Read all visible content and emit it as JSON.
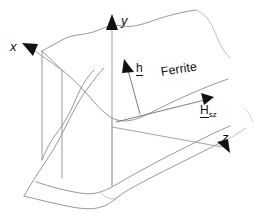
{
  "figure": {
    "background_color": "#ffffff",
    "line_color": "#8c8c8c",
    "arrow_color": "#111111",
    "width": 255,
    "height": 221
  },
  "axes": [
    {
      "id": "x",
      "label": "x",
      "direction": "up-left",
      "arrow_tip": {
        "x": 25,
        "y": 44
      },
      "arrow_tail": {
        "x": 62,
        "y": 70
      },
      "label_position": {
        "x": 10,
        "y": 40
      }
    },
    {
      "id": "y",
      "label": "y",
      "direction": "up",
      "arrow_tip": {
        "x": 112,
        "y": 16
      },
      "arrow_tail": {
        "x": 112,
        "y": 186
      },
      "label_position": {
        "x": 121,
        "y": 14
      }
    },
    {
      "id": "z",
      "label": "z",
      "direction": "down-right",
      "arrow_tip": {
        "x": 228,
        "y": 152
      },
      "arrow_tail": {
        "x": 112,
        "y": 127
      },
      "label_position": {
        "x": 222,
        "y": 131
      }
    }
  ],
  "vectors": [
    {
      "id": "h",
      "label": "h",
      "underlined": true,
      "subscript": "",
      "description": "RF magnetic field vector, normal to slab top face",
      "arrow_tip": {
        "x": 125,
        "y": 62
      },
      "arrow_tail": {
        "x": 140,
        "y": 113
      },
      "label_position": {
        "x": 136,
        "y": 62
      }
    },
    {
      "id": "Hsz",
      "label": "H",
      "underlined": true,
      "subscript": "sz",
      "description": "Static bias field along z direction",
      "arrow_tip": {
        "x": 212,
        "y": 94
      },
      "arrow_tail": {
        "x": 116,
        "y": 122
      },
      "label_position": {
        "x": 200,
        "y": 104
      }
    }
  ],
  "annotations": [
    {
      "id": "ferrite",
      "text": "Ferrite",
      "rotation_degrees": -9,
      "position": {
        "x": 162,
        "y": 66
      },
      "description": "Material label for the slab"
    }
  ],
  "slab": {
    "description": "Rectangular ferrite slab drawn in oblique projection with torn (wavy) broken-away edges",
    "style": "broken-out section with wavy boundaries",
    "faces": [
      "top",
      "left-side",
      "front"
    ]
  }
}
